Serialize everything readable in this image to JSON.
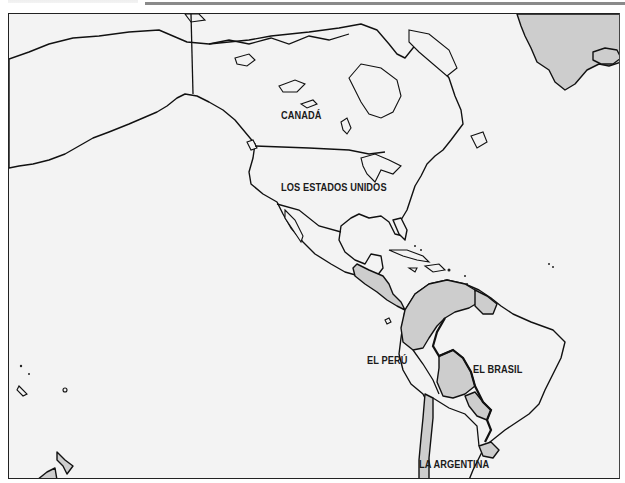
{
  "map": {
    "colors": {
      "ocean": "#f3f3f3",
      "land": "#f3f3f3",
      "highlighted_countries": "#cdcdcd",
      "outline": "#111111"
    },
    "labels": {
      "canada": "CANADÁ",
      "usa": "LOS ESTADOS UNIDOS",
      "peru": "EL PERÚ",
      "brazil": "EL BRASIL",
      "argentina": "LA ARGENTINA"
    },
    "highlighted_regions": [
      "Greenland",
      "Iceland",
      "Central America",
      "Colombia",
      "Venezuela",
      "Guyana",
      "Suriname",
      "French Guiana",
      "Ecuador",
      "Bolivia",
      "Paraguay",
      "Uruguay",
      "Chile",
      "New Zealand"
    ]
  }
}
